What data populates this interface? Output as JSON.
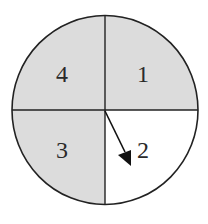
{
  "spinner": {
    "sections": [
      {
        "id": "1",
        "label": "1",
        "quadrant": "top-right",
        "fill": "#dcdcdc"
      },
      {
        "id": "2",
        "label": "2",
        "quadrant": "bottom-right",
        "fill": "#ffffff"
      },
      {
        "id": "3",
        "label": "3",
        "quadrant": "bottom-left",
        "fill": "#dcdcdc"
      },
      {
        "id": "4",
        "label": "4",
        "quadrant": "top-left",
        "fill": "#dcdcdc"
      }
    ],
    "pointer": {
      "points_to": "2",
      "icon": "arrow-pointer"
    },
    "colors": {
      "shaded": "#dcdcdc",
      "unshaded": "#ffffff",
      "outline": "#222222"
    }
  }
}
